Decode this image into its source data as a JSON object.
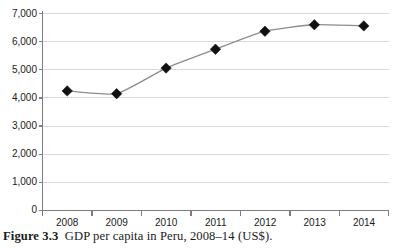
{
  "caption": {
    "label": "Figure 3.3",
    "text": "GDP per capita in Peru, 2008–14 (US$)."
  },
  "colors": {
    "gridline": "#d9d9d9",
    "axis": "#7d7d7d",
    "series_line": "#8c8c8c",
    "marker": "#101010",
    "background": "#ffffff",
    "text": "#1a1a1a"
  },
  "chart_data": {
    "type": "line",
    "title": "",
    "subtitle": "",
    "xlabel": "",
    "ylabel": "",
    "categories": [
      "2008",
      "2009",
      "2010",
      "2011",
      "2012",
      "2013",
      "2014"
    ],
    "values": [
      4250,
      4150,
      5060,
      5730,
      6370,
      6600,
      6560
    ],
    "series": [
      {
        "name": "GDP per capita (US$)",
        "values": [
          4250,
          4150,
          5060,
          5730,
          6370,
          6600,
          6560
        ]
      }
    ],
    "ylim": [
      0,
      7000
    ],
    "yticks": [
      0,
      1000,
      2000,
      3000,
      4000,
      5000,
      6000,
      7000
    ],
    "ytick_labels": [
      "0",
      "1,000",
      "2,000",
      "3,000",
      "4,000",
      "5,000",
      "6,000",
      "7,000"
    ],
    "xtick_labels": [
      "2008",
      "2009",
      "2010",
      "2011",
      "2012",
      "2013",
      "2014"
    ],
    "grid": "horizontal",
    "legend": "none",
    "marker_style": "filled-diamond"
  }
}
